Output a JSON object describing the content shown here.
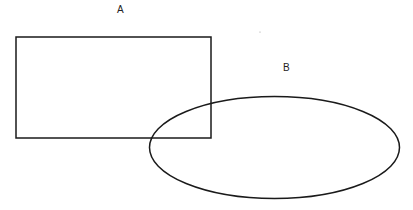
{
  "diagram": {
    "shapes": [
      {
        "id": "A",
        "type": "rectangle",
        "label": "A",
        "x": 16,
        "y": 37,
        "width": 195,
        "height": 101
      },
      {
        "id": "B",
        "type": "ellipse",
        "label": "B",
        "cx": 274,
        "cy": 147,
        "rx": 125,
        "ry": 51
      }
    ],
    "labels": {
      "a": "A",
      "b": "B"
    },
    "stroke_color": "#1a1a1a",
    "background": "#ffffff"
  }
}
